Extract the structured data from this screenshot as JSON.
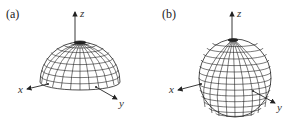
{
  "figure": {
    "panels": [
      {
        "label": "(a)",
        "shape": "hemisphere",
        "axes": {
          "x": "x",
          "y": "y",
          "z": "z"
        }
      },
      {
        "label": "(b)",
        "shape": "ellipsoid",
        "axes": {
          "x": "x",
          "y": "y",
          "z": "z"
        }
      }
    ],
    "colors": {
      "line": "#222222",
      "background": "#ffffff"
    }
  }
}
